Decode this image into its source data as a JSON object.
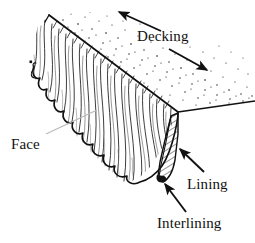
{
  "figure": {
    "width": 255,
    "height": 243,
    "background_color": "#ffffff",
    "ink_color": "#111111",
    "leader_color": "#b9b9b9"
  },
  "labels": {
    "decking": "Decking",
    "face": "Face",
    "lining": "Lining",
    "interlining": "Interlining"
  },
  "annotations": [
    {
      "name": "decking-arrow-upleft",
      "label": "Decking",
      "kind": "arrow",
      "from": [
        161,
        31
      ],
      "to": [
        117,
        11
      ],
      "direction": "up-left"
    },
    {
      "name": "decking-arrow-downright",
      "label": "Decking",
      "kind": "arrow",
      "from": [
        169,
        49
      ],
      "to": [
        209,
        71
      ],
      "direction": "down-right"
    },
    {
      "name": "face-leader",
      "label": "Face",
      "kind": "leader-line",
      "from": [
        46,
        134
      ],
      "to": [
        96,
        110
      ],
      "direction": "up-right"
    },
    {
      "name": "lining-arrow",
      "label": "Lining",
      "kind": "arrow",
      "from": [
        204,
        172
      ],
      "to": [
        178,
        147
      ],
      "direction": "up-left"
    },
    {
      "name": "interlining-arrow",
      "label": "Interlining",
      "kind": "arrow",
      "from": [
        186,
        212
      ],
      "to": [
        163,
        181
      ],
      "direction": "up-left"
    }
  ],
  "geometry": {
    "decking_fold_line": {
      "from": [
        49,
        15
      ],
      "to": [
        178,
        112
      ]
    },
    "right_edge_line": {
      "from": [
        178,
        112
      ],
      "to": [
        254,
        101
      ]
    },
    "lining_band": {
      "top": [
        178,
        113
      ],
      "bottom": [
        164,
        182
      ],
      "fill": "diagonal-hatch"
    },
    "pile_face_region": "wavy vertical strokes between fold line and scalloped hem",
    "stipple_region": "dotted texture above and right of the fold line"
  }
}
